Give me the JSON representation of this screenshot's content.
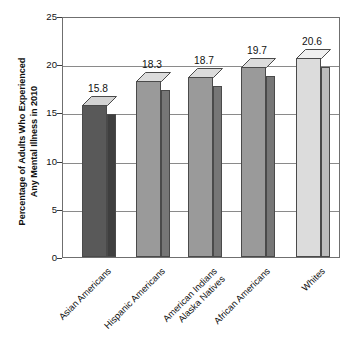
{
  "chart_data": {
    "type": "bar",
    "title": "",
    "subtitle": "",
    "xlabel": "",
    "ylabel": "Percentage of Adults Who Experienced\nAny Mental Illness in 2010",
    "ylabel_line1": "Percentage of Adults Who Experienced",
    "ylabel_line2": "Any Mental Illness in 2010",
    "categories": [
      "Asian Americans",
      "Hispanic Americans",
      "American Indians\nAlaska Natives",
      "African Americans",
      "Whites"
    ],
    "values": [
      15.8,
      18.3,
      18.7,
      19.7,
      20.6
    ],
    "value_labels": [
      "15.8",
      "18.3",
      "18.7",
      "19.7",
      "20.6"
    ],
    "ylim": [
      0,
      25
    ],
    "yticks": [
      0,
      5,
      10,
      15,
      20,
      25
    ],
    "ytick_labels": [
      "0",
      "5",
      "10",
      "15",
      "20",
      "25"
    ],
    "grid": true,
    "grid_axis": "y",
    "legend": "none",
    "bar_colors": [
      "#595959",
      "#9a9a9a",
      "#9a9a9a",
      "#9a9a9a",
      "#dcdcdc"
    ],
    "bar_side_colors": [
      "#3f3f3f",
      "#767676",
      "#767676",
      "#767676",
      "#bdbdbd"
    ],
    "bar_top_colors": [
      "#d3d3d3",
      "#dcdcdc",
      "#dcdcdc",
      "#dcdcdc",
      "#f0f0f0"
    ],
    "style": "3d-column",
    "axis_color": "#6f6f6f",
    "background": "#ffffff"
  }
}
